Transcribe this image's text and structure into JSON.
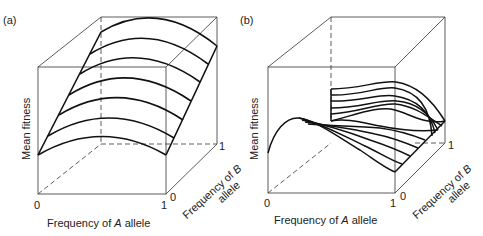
{
  "figure": {
    "panels": [
      {
        "id": "a",
        "label": "(a)",
        "y_axis_label": "Mean fitness",
        "x_axis_label_prefix": "Frequency of ",
        "x_axis_label_italic": "A",
        "x_axis_label_suffix": " allele",
        "x_ticks": [
          "0",
          "1"
        ],
        "z_axis_label_line1_prefix": "Frequency of ",
        "z_axis_label_line1_italic": "B",
        "z_axis_label_line2": "allele",
        "z_ticks": [
          "0",
          "1"
        ],
        "surface": "single-peaked ridge rising with frequency of B allele"
      },
      {
        "id": "b",
        "label": "(b)",
        "y_axis_label": "Mean fitness",
        "x_axis_label_prefix": "Frequency of ",
        "x_axis_label_italic": "A",
        "x_axis_label_suffix": " allele",
        "x_ticks": [
          "0",
          "1"
        ],
        "z_axis_label_line1_prefix": "Frequency of ",
        "z_axis_label_line1_italic": "B",
        "z_axis_label_line2": "allele",
        "z_ticks": [
          "0",
          "1"
        ],
        "surface": "two-peaked surface with a saddle between peaks"
      }
    ]
  }
}
